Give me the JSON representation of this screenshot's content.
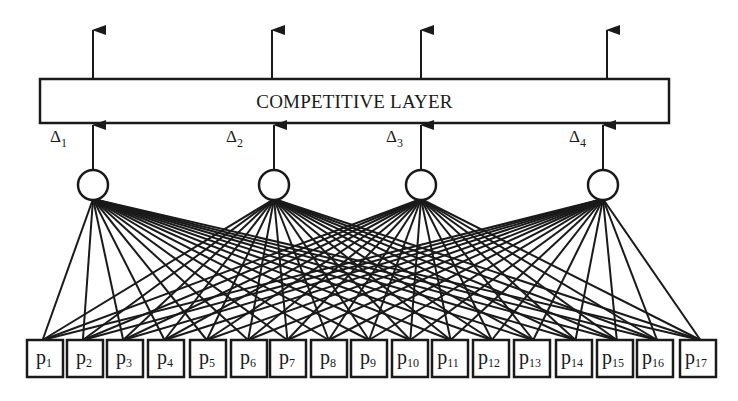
{
  "diagram": {
    "competitive_layer": {
      "label": "COMPETITIVE LAYER",
      "x": 40,
      "y": 79,
      "width": 629,
      "height": 44
    },
    "output_arrows": [
      {
        "x": 93
      },
      {
        "x": 272
      },
      {
        "x": 421
      },
      {
        "x": 607
      }
    ],
    "hidden_nodes": [
      {
        "id": "n1",
        "cx": 93,
        "cy": 185,
        "r": 15,
        "delta_label": "Δ",
        "delta_sub": "1",
        "label_x": 50,
        "label_y": 142,
        "arrow_x": 93
      },
      {
        "id": "n2",
        "cx": 274,
        "cy": 185,
        "r": 15,
        "delta_label": "Δ",
        "delta_sub": "2",
        "label_x": 226,
        "label_y": 142,
        "arrow_x": 274
      },
      {
        "id": "n3",
        "cx": 421,
        "cy": 185,
        "r": 15,
        "delta_label": "Δ",
        "delta_sub": "3",
        "label_x": 386,
        "label_y": 142,
        "arrow_x": 421
      },
      {
        "id": "n4",
        "cx": 603,
        "cy": 185,
        "r": 15,
        "delta_label": "Δ",
        "delta_sub": "4",
        "label_x": 569,
        "label_y": 142,
        "arrow_x": 603
      }
    ],
    "input_nodes": [
      {
        "label": "p",
        "sub": "1",
        "x": 27
      },
      {
        "label": "p",
        "sub": "2",
        "x": 67
      },
      {
        "label": "p",
        "sub": "3",
        "x": 107
      },
      {
        "label": "p",
        "sub": "4",
        "x": 148
      },
      {
        "label": "p",
        "sub": "5",
        "x": 190
      },
      {
        "label": "p",
        "sub": "6",
        "x": 231
      },
      {
        "label": "p",
        "sub": "7",
        "x": 270
      },
      {
        "label": "p",
        "sub": "8",
        "x": 311
      },
      {
        "label": "p",
        "sub": "9",
        "x": 351
      },
      {
        "label": "p",
        "sub": "10",
        "x": 392
      },
      {
        "label": "p",
        "sub": "11",
        "x": 432
      },
      {
        "label": "p",
        "sub": "12",
        "x": 473
      },
      {
        "label": "p",
        "sub": "13",
        "x": 514
      },
      {
        "label": "p",
        "sub": "14",
        "x": 556
      },
      {
        "label": "p",
        "sub": "15",
        "x": 597
      },
      {
        "label": "p",
        "sub": "16",
        "x": 637
      },
      {
        "label": "p",
        "sub": "17",
        "x": 680
      }
    ],
    "input_box": {
      "y": 340,
      "width": 36,
      "height": 37
    },
    "connections": "fully-connected: every input node p1..p17 to every hidden node",
    "colors": {
      "stroke": "#1a1a1a",
      "background": "#ffffff"
    }
  }
}
